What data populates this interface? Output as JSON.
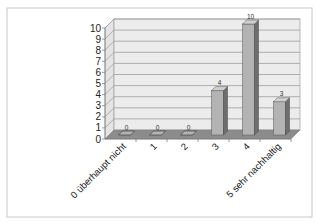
{
  "chart_data": {
    "type": "bar",
    "title": "",
    "xlabel": "",
    "ylabel": "",
    "categories": [
      "0 überhaupt nicht",
      "1",
      "2",
      "3",
      "4",
      "5 sehr nachhaltig"
    ],
    "values": [
      0,
      0,
      0,
      4,
      10,
      3
    ],
    "data_labels": [
      "0",
      "0",
      "0",
      "4",
      "10",
      "3"
    ],
    "ylim": [
      0,
      10
    ],
    "yticks": [
      "0",
      "1",
      "2",
      "3",
      "4",
      "5",
      "6",
      "7",
      "8",
      "9",
      "10"
    ],
    "grid": true,
    "legend": "none",
    "style": "3d-column",
    "colors": {
      "bar_front": "#b3b3b3",
      "bar_side": "#6e6e6e",
      "bar_top": "#d0d0d0",
      "wall": "#ececec",
      "floor": "#8c8c8c",
      "gridline": "#9e9e9e",
      "frame_border": "#c8c8c8"
    }
  }
}
